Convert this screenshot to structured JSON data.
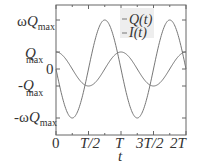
{
  "chart_data": {
    "type": "line",
    "title": "",
    "xlabel": "t",
    "ylabel": "",
    "x_ticks": [
      "0",
      "T/2",
      "T",
      "3T/2",
      "2T"
    ],
    "y_ticks": [
      "ωQmax",
      "Qmax",
      "0",
      "-Qmax",
      "-ωQmax"
    ],
    "xlim": [
      0,
      2
    ],
    "x_unit": "T",
    "series": [
      {
        "name": "Q(t)",
        "expr": "Qmax·cos(2πt/T)",
        "amplitude": "Qmax",
        "color": "#777777"
      },
      {
        "name": "I(t)",
        "expr": "-ωQmax·sin(2πt/T)",
        "amplitude": "ωQmax",
        "color": "#777777"
      }
    ],
    "legend_position": "upper right",
    "grid": false
  },
  "legend": {
    "q": "Q(t)",
    "i": "I(t)"
  },
  "yticks": {
    "wq": "ω",
    "q": "Q",
    "max": "max",
    "zero": "0",
    "neg": "-"
  },
  "xticks": {
    "t0": "0",
    "t1": "T/2",
    "t2": "T",
    "t3": "3T/2",
    "t4": "2T"
  },
  "xlabel": "t"
}
